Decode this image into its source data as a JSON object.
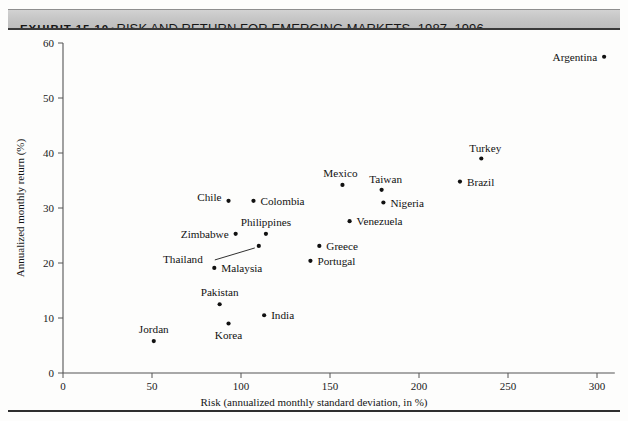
{
  "header": {
    "exhibit_number": "EXHIBIT 15.10",
    "separator": "•",
    "title": "RISK AND RETURN FOR EMERGING MARKETS, 1987–1996"
  },
  "colors": {
    "banner_gray": "#c6c6c6",
    "rule_dark": "#3a3a3a",
    "point": "#111111",
    "axis": "#555555",
    "text": "#111111",
    "background": "#fdfdfc"
  },
  "chart_data": {
    "type": "scatter",
    "title": "Risk and Return for Emerging Markets, 1987–1996",
    "xlabel": "Risk (annualized monthly standard deviation, in %)",
    "ylabel": "Annualized monthly return (%)",
    "xlim": [
      0,
      310
    ],
    "ylim": [
      0,
      60
    ],
    "xticks": [
      0,
      50,
      100,
      150,
      200,
      250,
      300
    ],
    "yticks": [
      0,
      10,
      20,
      30,
      40,
      50,
      60
    ],
    "xtick_labels": [
      "0",
      "50",
      "100",
      "150",
      "200",
      "250",
      "300"
    ],
    "ytick_labels": [
      "0",
      "10",
      "20",
      "30",
      "40",
      "50",
      "60"
    ],
    "grid": false,
    "legend": false,
    "marker": "dot",
    "points": [
      {
        "name": "Argentina",
        "x": 304,
        "y": 57.5,
        "label_pos": "left",
        "dx": -7,
        "dy": 4
      },
      {
        "name": "Turkey",
        "x": 235,
        "y": 39.0,
        "label_pos": "above",
        "dx": 4,
        "dy": -7
      },
      {
        "name": "Brazil",
        "x": 223,
        "y": 34.8,
        "label_pos": "right",
        "dx": 7,
        "dy": 4
      },
      {
        "name": "Taiwan",
        "x": 179,
        "y": 33.3,
        "label_pos": "above",
        "dx": 4,
        "dy": -7
      },
      {
        "name": "Nigeria",
        "x": 180,
        "y": 31.0,
        "label_pos": "right",
        "dx": 7,
        "dy": 4
      },
      {
        "name": "Mexico",
        "x": 157,
        "y": 34.2,
        "label_pos": "above",
        "dx": -2,
        "dy": -8
      },
      {
        "name": "Venezuela",
        "x": 161,
        "y": 27.6,
        "label_pos": "right",
        "dx": 7,
        "dy": 4
      },
      {
        "name": "Chile",
        "x": 93,
        "y": 31.3,
        "label_pos": "left",
        "dx": -7,
        "dy": 0
      },
      {
        "name": "Colombia",
        "x": 107,
        "y": 31.3,
        "label_pos": "right",
        "dx": 7,
        "dy": 4
      },
      {
        "name": "Philippines",
        "x": 114,
        "y": 25.3,
        "label_pos": "above",
        "dx": 0,
        "dy": -8
      },
      {
        "name": "Zimbabwe",
        "x": 97,
        "y": 25.3,
        "label_pos": "left",
        "dx": -7,
        "dy": 4
      },
      {
        "name": "Thailand",
        "x": 110,
        "y": 23.1,
        "label_pos": "leader",
        "dx": -56,
        "dy": 17
      },
      {
        "name": "Greece",
        "x": 144,
        "y": 23.1,
        "label_pos": "right",
        "dx": 7,
        "dy": 4
      },
      {
        "name": "Portugal",
        "x": 139,
        "y": 20.4,
        "label_pos": "right",
        "dx": 7,
        "dy": 4
      },
      {
        "name": "Malaysia",
        "x": 85,
        "y": 19.1,
        "label_pos": "right",
        "dx": 7,
        "dy": 4
      },
      {
        "name": "Pakistan",
        "x": 88,
        "y": 12.5,
        "label_pos": "above",
        "dx": 0,
        "dy": -8
      },
      {
        "name": "India",
        "x": 113,
        "y": 10.5,
        "label_pos": "right",
        "dx": 7,
        "dy": 4
      },
      {
        "name": "Korea",
        "x": 93,
        "y": 9.0,
        "label_pos": "below",
        "dx": 0,
        "dy": 15
      },
      {
        "name": "Jordan",
        "x": 51,
        "y": 5.8,
        "label_pos": "above",
        "dx": 0,
        "dy": -8
      }
    ]
  }
}
